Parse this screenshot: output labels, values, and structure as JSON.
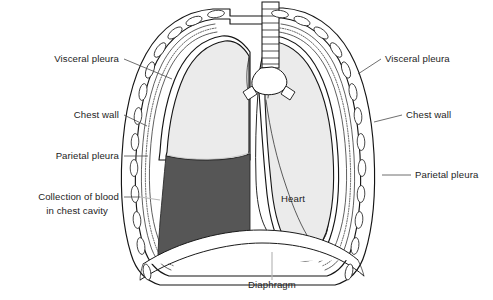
{
  "figure": {
    "background_color": "#ffffff",
    "width": 493,
    "height": 300
  },
  "colors": {
    "lung_fill": "#ebebeb",
    "blood_fill": "#565656",
    "chest_wall_fill": "#f2f2f2",
    "pleura_band": "#fafafa",
    "outline": "#151515",
    "leader_line": "#4a4a4a",
    "leader_line_light": "#b9b9b9",
    "text": "#1d1d1d",
    "heart_fill": "#ffffff",
    "diaphragm_fill": "#ffffff"
  },
  "labels": {
    "left": [
      {
        "id": "visceral-pleura-left",
        "text": "Visceral pleura",
        "x": 119,
        "y": 62
      },
      {
        "id": "chest-wall-left",
        "text": "Chest wall",
        "x": 119,
        "y": 118
      },
      {
        "id": "parietal-pleura-left",
        "text": "Parietal pleura",
        "x": 119,
        "y": 159
      },
      {
        "id": "collection-of-blood-line1",
        "text": "Collection of blood",
        "x": 119,
        "y": 200
      },
      {
        "id": "collection-of-blood-line2",
        "text": "in chest cavity",
        "x": 108,
        "y": 214
      }
    ],
    "right": [
      {
        "id": "visceral-pleura-right",
        "text": "Visceral pleura",
        "x": 385,
        "y": 62
      },
      {
        "id": "chest-wall-right",
        "text": "Chest wall",
        "x": 406,
        "y": 118
      },
      {
        "id": "parietal-pleura-right",
        "text": "Parietal pleura",
        "x": 415,
        "y": 178
      }
    ],
    "center": [
      {
        "id": "heart",
        "text": "Heart",
        "x": 293,
        "y": 202
      },
      {
        "id": "diaphragm",
        "text": "Diaphragm",
        "x": 272,
        "y": 288
      }
    ]
  },
  "structures": [
    {
      "id": "trachea",
      "name": "Trachea with cartilage rings",
      "ring_count": 9
    },
    {
      "id": "carina",
      "name": "Tracheal bifurcation / main bronchi"
    },
    {
      "id": "left-lung",
      "name": "Patient's right lung (image left), partially collapsed"
    },
    {
      "id": "right-lung",
      "name": "Patient's left lung (image right), with cardiac notch"
    },
    {
      "id": "heart-silhouette",
      "name": "Heart"
    },
    {
      "id": "diaphragm-dome",
      "name": "Diaphragm"
    },
    {
      "id": "blood-collection",
      "name": "Collection of blood in chest cavity (hemothorax)"
    },
    {
      "id": "rib-cage",
      "name": "Chest wall with rib cross-sections",
      "rib_count_left": 11,
      "rib_count_right": 11
    },
    {
      "id": "pleural-membranes",
      "name": "Parietal and visceral pleura (stippled bands)"
    }
  ]
}
